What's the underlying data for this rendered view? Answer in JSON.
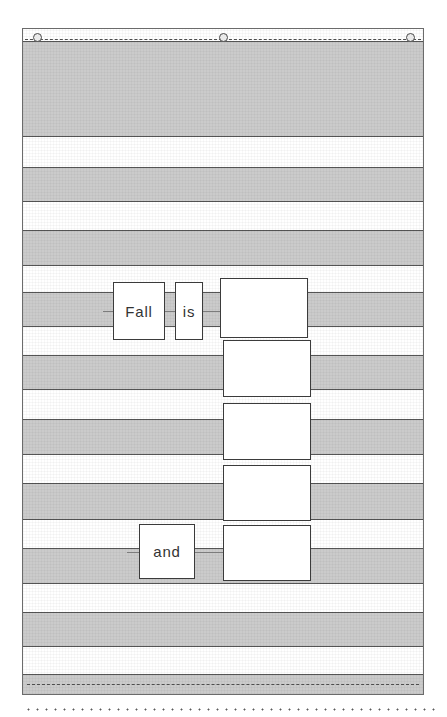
{
  "page": {
    "kind": "scanned-form-page",
    "background_color": "#ffffff",
    "sheet_border_color": "#6b6b6b",
    "band_gray_color": "#cbcbcb",
    "band_line_color": "#555555",
    "box_border_color": "#3b3b3b",
    "text_color": "#333333"
  },
  "punch_holes": [
    {
      "name": "punch-hole-left",
      "x": 10,
      "y": 4
    },
    {
      "name": "punch-hole-center",
      "x": 196,
      "y": 4
    },
    {
      "name": "punch-hole-right",
      "x": 383,
      "y": 4
    }
  ],
  "bands": [
    {
      "type": "gray",
      "top": 12,
      "height": 96
    },
    {
      "type": "white",
      "top": 108,
      "height": 30
    },
    {
      "type": "gray",
      "top": 138,
      "height": 35
    },
    {
      "type": "white",
      "top": 173,
      "height": 28
    },
    {
      "type": "gray",
      "top": 201,
      "height": 36
    },
    {
      "type": "white",
      "top": 237,
      "height": 26
    },
    {
      "type": "gray",
      "top": 263,
      "height": 35
    },
    {
      "type": "white",
      "top": 298,
      "height": 28
    },
    {
      "type": "gray",
      "top": 326,
      "height": 35
    },
    {
      "type": "white",
      "top": 361,
      "height": 29
    },
    {
      "type": "gray",
      "top": 390,
      "height": 36
    },
    {
      "type": "white",
      "top": 426,
      "height": 28
    },
    {
      "type": "gray",
      "top": 454,
      "height": 37
    },
    {
      "type": "white",
      "top": 491,
      "height": 28
    },
    {
      "type": "gray",
      "top": 519,
      "height": 36
    },
    {
      "type": "white",
      "top": 555,
      "height": 28
    },
    {
      "type": "gray",
      "top": 583,
      "height": 35
    },
    {
      "type": "white",
      "top": 618,
      "height": 27
    },
    {
      "type": "gray",
      "top": 645,
      "height": 22
    }
  ],
  "boxes": [
    {
      "name": "word-box-fall",
      "label": "Fall",
      "left": 90,
      "top": 253,
      "width": 52,
      "height": 58
    },
    {
      "name": "word-box-is",
      "label": "is",
      "left": 152,
      "top": 253,
      "width": 28,
      "height": 58
    },
    {
      "name": "blank-box-1",
      "label": "",
      "left": 197,
      "top": 249,
      "width": 88,
      "height": 60
    },
    {
      "name": "blank-box-2",
      "label": "",
      "left": 200,
      "top": 311,
      "width": 88,
      "height": 57
    },
    {
      "name": "blank-box-3",
      "label": "",
      "left": 200,
      "top": 374,
      "width": 88,
      "height": 57
    },
    {
      "name": "blank-box-4",
      "label": "",
      "left": 200,
      "top": 436,
      "width": 88,
      "height": 56
    },
    {
      "name": "word-box-and",
      "label": "and",
      "left": 116,
      "top": 495,
      "width": 56,
      "height": 55
    },
    {
      "name": "blank-box-5",
      "label": "",
      "left": 200,
      "top": 496,
      "width": 88,
      "height": 56
    }
  ],
  "connector_rules": [
    {
      "name": "rule-fall-left",
      "left": 80,
      "top": 282,
      "width": 12
    },
    {
      "name": "rule-fall-is",
      "left": 140,
      "top": 282,
      "width": 14
    },
    {
      "name": "rule-is-blank1",
      "left": 178,
      "top": 282,
      "width": 21
    },
    {
      "name": "rule-and-left",
      "left": 104,
      "top": 523,
      "width": 14
    },
    {
      "name": "rule-and-blank5",
      "left": 170,
      "top": 523,
      "width": 32
    }
  ],
  "dashed_fills": [
    {
      "name": "dash-fill-1",
      "left": 204,
      "top": 281,
      "width": 76
    },
    {
      "name": "dash-fill-2",
      "left": 206,
      "top": 342,
      "width": 74
    },
    {
      "name": "dash-fill-3",
      "left": 206,
      "top": 404,
      "width": 74
    },
    {
      "name": "dash-fill-4",
      "left": 206,
      "top": 466,
      "width": 74
    },
    {
      "name": "dash-fill-5",
      "left": 206,
      "top": 525,
      "width": 74
    }
  ],
  "bottom_strip": {
    "name": "dotted-edge-strip"
  }
}
